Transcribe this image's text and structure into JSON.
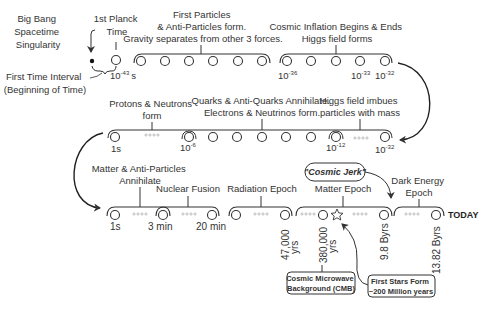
{
  "row1": {
    "singularity_label": [
      "Big Bang",
      "Spacetime",
      "Singularity"
    ],
    "first_interval_label": [
      "First Time Interval",
      "(Beginning of Time)"
    ],
    "planck_label": [
      "1st Planck",
      "Time"
    ],
    "planck_time": {
      "base": "10",
      "exp": "-43",
      "unit": "s"
    },
    "particles_label": [
      "First Particles",
      "& Anti-Particles form.",
      "Gravity separates from other 3 forces."
    ],
    "inflation_label": [
      "Cosmic Inflation Begins & Ends",
      "Higgs field forms"
    ],
    "ticks": [
      {
        "base": "10",
        "exp": "-36"
      },
      {
        "base": "10",
        "exp": "-33"
      },
      {
        "base": "10",
        "exp": "-32"
      }
    ]
  },
  "row2": {
    "protons_label": [
      "Protons & Neutrons",
      "form"
    ],
    "quarks_label": [
      "Quarks & Anti-Quarks Annihilate.",
      "Electrons & Neutrinos form."
    ],
    "higgs_label": [
      "Higgs field imbues",
      "particles with mass"
    ],
    "ticks": [
      {
        "base": "1s",
        "exp": ""
      },
      {
        "base": "10",
        "exp": "-6"
      },
      {
        "base": "10",
        "exp": "-12"
      },
      {
        "base": "10",
        "exp": "-32"
      }
    ]
  },
  "row3": {
    "annihilate_label": [
      "Matter & Anti-Particles",
      "Annihilate"
    ],
    "fusion_label": "Nuclear Fusion",
    "radiation_label": "Radiation Epoch",
    "matter_label": "Matter Epoch",
    "dark_energy_label": [
      "Dark Energy",
      "Epoch"
    ],
    "cosmic_jerk": "\"Cosmic Jerk\"",
    "today": "TODAY",
    "ticks": [
      "1s",
      "3 min",
      "20 min"
    ],
    "vertical_ticks": [
      [
        "47,000",
        "yrs"
      ],
      [
        "380,000",
        "yrs"
      ],
      [
        "9.8 Byrs"
      ],
      [
        "13.82 Byrs"
      ]
    ],
    "cmb_box": [
      "Cosmic Microwave",
      "Background (CMB)"
    ],
    "stars_box": [
      "First Stars Form",
      "~200 Million years"
    ]
  },
  "colors": {
    "ink": "#333333",
    "dots": "#9a9a9a"
  }
}
